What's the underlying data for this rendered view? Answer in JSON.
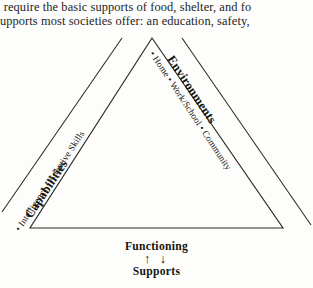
{
  "page": {
    "body_text_lines": [
      "l require the basic supports of food, shelter, and fo",
      "supports most societies offer: an education, safety,"
    ]
  },
  "figure": {
    "left_side": {
      "title": "Capabilities",
      "items_text": "• Intelligence   •  Adaptive Skills",
      "items": [
        "Intelligence",
        "Adaptive Skills"
      ]
    },
    "right_side": {
      "title": "Environments",
      "items_text": "•  Home   •  Work/School  •  Community",
      "items": [
        "Home",
        "Work/School",
        "Community"
      ]
    },
    "caption": {
      "top_label": "Functioning",
      "arrows": "↑ ↓",
      "bottom_label": "Supports"
    },
    "colors": {
      "ink": "#15150f",
      "paper": "#fdfdfb",
      "line": "#2a2a24"
    }
  }
}
